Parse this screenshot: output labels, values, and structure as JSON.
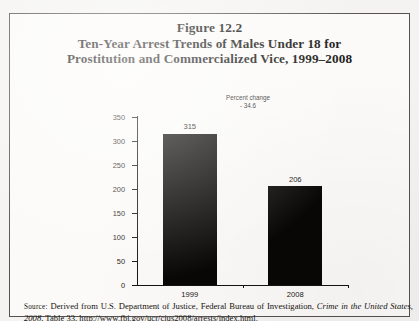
{
  "figure": {
    "title_line_1": "Figure 12.2",
    "title_line_2": "Ten-Year Arrest Trends of Males Under 18 for",
    "title_line_3": "Prostitution and Commercialized Vice, 1999–2008"
  },
  "annotation": {
    "label": "Percent change",
    "value": "- 34.6"
  },
  "source": {
    "prefix": "Source:",
    "text_before_italic": " Derived from U.S. Department of Justice, Federal Bureau of Investigation, ",
    "italic_title": "Crime in the United States, 2008",
    "text_after_italic": ", Table 33, http://www.fbi.gov/ucr/cius2008/arrests/index.html."
  },
  "chart_data": {
    "type": "bar",
    "title": "Ten-Year Arrest Trends of Males Under 18 for Prostitution and Commercialized Vice, 1999–2008",
    "categories": [
      "1999",
      "2008"
    ],
    "values": [
      315,
      206
    ],
    "value_labels": [
      "315",
      "206"
    ],
    "xlabel": "",
    "ylabel": "",
    "ylim": [
      0,
      350
    ],
    "ytick_values": [
      0,
      50,
      100,
      150,
      200,
      250,
      300,
      350
    ],
    "ytick_labels": [
      "0",
      "50",
      "100",
      "150",
      "200",
      "250",
      "300",
      "350"
    ],
    "grid": false,
    "legend": false,
    "bar_color": "#080705",
    "percent_change": -34.6,
    "annotation": "Percent change - 34.6"
  }
}
